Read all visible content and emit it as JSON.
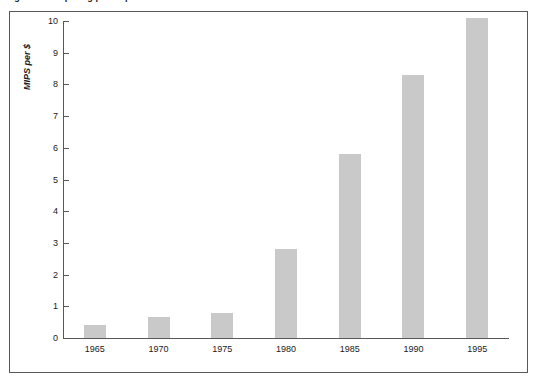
{
  "caption": {
    "text": "Figure 1  Computing power per dollar"
  },
  "chart_data": {
    "type": "bar",
    "title": "",
    "xlabel": "",
    "ylabel": "MIPS per $",
    "categories": [
      "1965",
      "1970",
      "1975",
      "1980",
      "1985",
      "1990",
      "1995"
    ],
    "values": [
      0.4,
      0.65,
      0.8,
      2.8,
      5.8,
      8.3,
      10.1
    ],
    "ylim": [
      0,
      10
    ],
    "yticks": [
      "0",
      "1",
      "2",
      "3",
      "4",
      "5",
      "6",
      "7",
      "8",
      "9",
      "10"
    ],
    "grid": false,
    "legend": false,
    "bar_color": "#c9c9c9",
    "axis_color": "#58585a",
    "frame_color": "#58585a"
  }
}
